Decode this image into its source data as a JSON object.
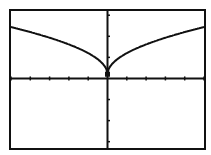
{
  "chart_data": {
    "type": "line",
    "title": "",
    "function": "y = sqrt(|x|)",
    "xlabel": "",
    "ylabel": "",
    "xlim": [
      -5,
      5
    ],
    "ylim": [
      -3.3,
      3.2
    ],
    "x_tick_step": 1,
    "y_tick_step": 1,
    "grid": false,
    "legend": null,
    "x": [
      -5,
      -4,
      -3,
      -2,
      -1,
      0,
      1,
      2,
      3,
      4,
      5
    ],
    "series": [
      {
        "name": "y = sqrt(|x|)",
        "values": [
          2.24,
          2.0,
          1.73,
          1.41,
          1.0,
          0.0,
          1.0,
          1.41,
          1.73,
          2.0,
          2.24
        ]
      }
    ]
  },
  "colors": {
    "ink": "#111111",
    "background": "#ffffff"
  },
  "caption": ""
}
